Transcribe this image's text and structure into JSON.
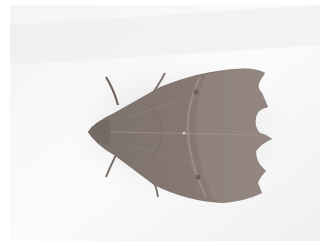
{
  "image": {
    "subject": "moth",
    "description": "Brown-grey moth with scalloped wing edges resting on a pale white surface",
    "colors": {
      "background": "#f2f2f2",
      "background_light": "#fafafa",
      "wing": "#8a7d76",
      "wing_dark": "#6f625c",
      "wing_light": "#9a8d86",
      "shadow": "#d2d2d2",
      "antenna": "#7a6e68"
    }
  }
}
